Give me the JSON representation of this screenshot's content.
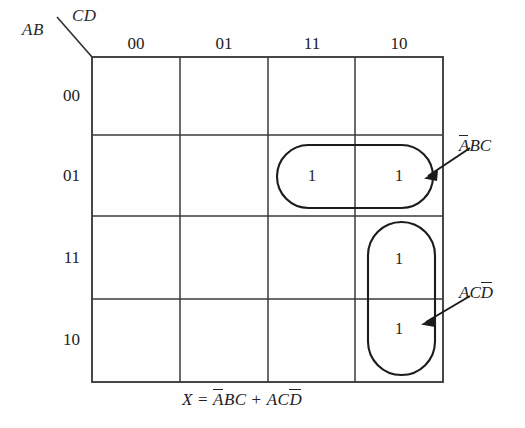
{
  "diagram": {
    "type": "karnaugh-map",
    "variables": {
      "row_label": "AB",
      "col_label": "CD"
    },
    "column_headers": [
      "00",
      "01",
      "11",
      "10"
    ],
    "row_headers": [
      "00",
      "01",
      "11",
      "10"
    ],
    "cells": [
      [
        "",
        "",
        "",
        ""
      ],
      [
        "",
        "",
        "1",
        "1"
      ],
      [
        "",
        "",
        "",
        "1"
      ],
      [
        "",
        "",
        "",
        "1"
      ]
    ],
    "groups": [
      {
        "name": "group-abc",
        "label_plain": "ABC",
        "label_parts": [
          {
            "text": "A",
            "overbar": true
          },
          {
            "text": "B",
            "overbar": false
          },
          {
            "text": "C",
            "overbar": false
          }
        ],
        "covers": "row 01, columns 11 and 10"
      },
      {
        "name": "group-acd",
        "label_plain": "ACD",
        "label_parts": [
          {
            "text": "A",
            "overbar": false
          },
          {
            "text": "C",
            "overbar": false
          },
          {
            "text": "D",
            "overbar": true
          }
        ],
        "covers": "column 10, rows 11 and 10"
      }
    ],
    "equation": {
      "lhs": "X",
      "operator": "=",
      "plus": "+",
      "term1": [
        {
          "text": "A",
          "overbar": true
        },
        {
          "text": "B",
          "overbar": false
        },
        {
          "text": "C",
          "overbar": false
        }
      ],
      "term2": [
        {
          "text": "A",
          "overbar": false
        },
        {
          "text": "C",
          "overbar": false
        },
        {
          "text": "D",
          "overbar": true
        }
      ],
      "plain": "X = ABC + ACD"
    },
    "colors": {
      "ink": "#222222",
      "grid": "#3a3a3a",
      "background": "#fefefe"
    }
  }
}
